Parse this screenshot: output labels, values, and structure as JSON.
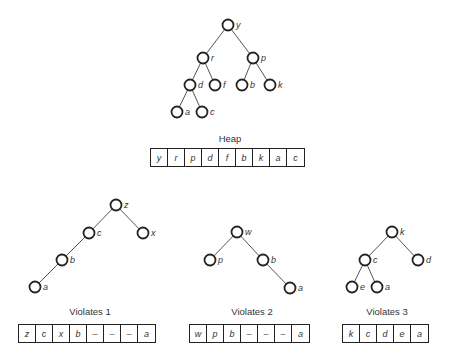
{
  "heap": {
    "caption": "Heap",
    "tree": {
      "nodes": [
        {
          "id": "y",
          "label": "y",
          "x": 228,
          "y": 25
        },
        {
          "id": "r",
          "label": "r",
          "x": 203,
          "y": 58
        },
        {
          "id": "p",
          "label": "p",
          "x": 253,
          "y": 58
        },
        {
          "id": "d",
          "label": "d",
          "x": 190,
          "y": 85
        },
        {
          "id": "f",
          "label": "f",
          "x": 215,
          "y": 85
        },
        {
          "id": "b",
          "label": "b",
          "x": 242,
          "y": 85
        },
        {
          "id": "k",
          "label": "k",
          "x": 270,
          "y": 85
        },
        {
          "id": "a",
          "label": "a",
          "x": 177,
          "y": 112
        },
        {
          "id": "c",
          "label": "c",
          "x": 202,
          "y": 112
        }
      ],
      "edges": [
        [
          "y",
          "r"
        ],
        [
          "y",
          "p"
        ],
        [
          "r",
          "d"
        ],
        [
          "r",
          "f"
        ],
        [
          "p",
          "b"
        ],
        [
          "p",
          "k"
        ],
        [
          "d",
          "a"
        ],
        [
          "d",
          "c"
        ]
      ]
    },
    "array": [
      "y",
      "r",
      "p",
      "d",
      "f",
      "b",
      "k",
      "a",
      "c"
    ]
  },
  "violates1": {
    "caption": "Violates 1",
    "tree": {
      "nodes": [
        {
          "id": "z",
          "label": "z",
          "x": 116,
          "y": 205
        },
        {
          "id": "c",
          "label": "c",
          "x": 89,
          "y": 233
        },
        {
          "id": "x",
          "label": "x",
          "x": 143,
          "y": 233
        },
        {
          "id": "b",
          "label": "b",
          "x": 62,
          "y": 260
        },
        {
          "id": "a",
          "label": "a",
          "x": 35,
          "y": 287
        }
      ],
      "edges": [
        [
          "z",
          "c"
        ],
        [
          "z",
          "x"
        ],
        [
          "c",
          "b"
        ],
        [
          "b",
          "a"
        ]
      ]
    },
    "array": [
      "z",
      "c",
      "x",
      "b",
      "–",
      "–",
      "–",
      "a"
    ]
  },
  "violates2": {
    "caption": "Violates 2",
    "tree": {
      "nodes": [
        {
          "id": "w",
          "label": "w",
          "x": 237,
          "y": 232
        },
        {
          "id": "p",
          "label": "p",
          "x": 210,
          "y": 260
        },
        {
          "id": "b",
          "label": "b",
          "x": 263,
          "y": 260
        },
        {
          "id": "a",
          "label": "a",
          "x": 290,
          "y": 288
        }
      ],
      "edges": [
        [
          "w",
          "p"
        ],
        [
          "w",
          "b"
        ],
        [
          "b",
          "a"
        ]
      ]
    },
    "array": [
      "w",
      "p",
      "b",
      "–",
      "–",
      "–",
      "a"
    ]
  },
  "violates3": {
    "caption": "Violates 3",
    "tree": {
      "nodes": [
        {
          "id": "k",
          "label": "k",
          "x": 392,
          "y": 232
        },
        {
          "id": "c",
          "label": "c",
          "x": 365,
          "y": 260
        },
        {
          "id": "d",
          "label": "d",
          "x": 418,
          "y": 260
        },
        {
          "id": "e",
          "label": "e",
          "x": 352,
          "y": 287
        },
        {
          "id": "a",
          "label": "a",
          "x": 377,
          "y": 287
        }
      ],
      "edges": [
        [
          "k",
          "c"
        ],
        [
          "k",
          "d"
        ],
        [
          "c",
          "e"
        ],
        [
          "c",
          "a"
        ]
      ]
    },
    "array": [
      "k",
      "c",
      "d",
      "e",
      "a"
    ]
  }
}
